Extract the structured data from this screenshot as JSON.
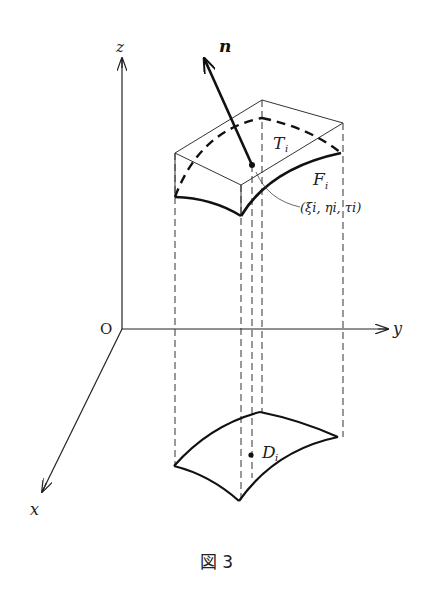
{
  "figure": {
    "caption": "図 3",
    "axes": {
      "origin_label": "O",
      "x_label": "x",
      "y_label": "y",
      "z_label": "z"
    },
    "labels": {
      "normal_vector": "n",
      "tangent_plane": "T",
      "tangent_plane_sub": "i",
      "surface_patch": "F",
      "surface_patch_sub": "i",
      "domain_region": "D",
      "domain_region_sub": "i",
      "point": "(ξi, ηi, τi)"
    },
    "colors": {
      "ink": "#222222",
      "background": "#ffffff"
    }
  }
}
